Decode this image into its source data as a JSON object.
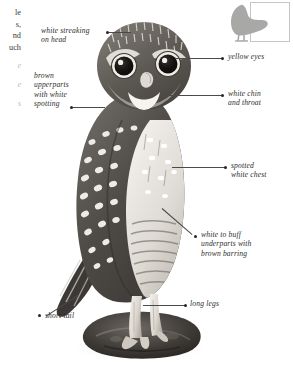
{
  "plate": {
    "subject": "Little Owl",
    "background_color": "#ffffff",
    "label_color": "#2e2e2c",
    "leader_color": "#4a4a48"
  },
  "edge_text": {
    "note": "right-edge fragments of an adjacent text column, clipped by the page crop",
    "fragments": [
      "le",
      "s,",
      "nd",
      "uch"
    ],
    "faint_fragments": [
      "e",
      "e",
      "s"
    ]
  },
  "inset": {
    "name": "perched-owl-silhouette",
    "color": "#a8a8a6",
    "box_color": "#c6c6c4"
  },
  "annotations": [
    {
      "id": "white-streaking-on-head",
      "text": "white streaking\non head",
      "side": "left"
    },
    {
      "id": "brown-upperparts-with-white-spotting",
      "text": "brown\nupperparts\nwith white\nspotting",
      "side": "left"
    },
    {
      "id": "short-tail",
      "text": "short tail",
      "side": "left"
    },
    {
      "id": "yellow-eyes",
      "text": "yellow eyes",
      "side": "right"
    },
    {
      "id": "white-chin-and-throat",
      "text": "white chin\nand throat",
      "side": "right"
    },
    {
      "id": "spotted-white-chest",
      "text": "spotted\nwhite chest",
      "side": "right"
    },
    {
      "id": "white-to-buff-underparts-with-brown-barring",
      "text": "white to buff\nunderparts with\nbrown barring",
      "side": "right"
    },
    {
      "id": "long-legs",
      "text": "long legs",
      "side": "right"
    }
  ]
}
